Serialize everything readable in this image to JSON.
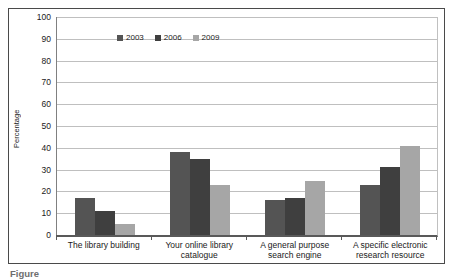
{
  "caption_partial": "Figure",
  "chart_data": {
    "type": "bar",
    "title": "",
    "ylabel": "Percentage",
    "xlabel": "",
    "ylim": [
      0,
      100
    ],
    "yticks": [
      0,
      10,
      20,
      30,
      40,
      50,
      60,
      70,
      80,
      90,
      100
    ],
    "grid": true,
    "legend_position": "top-left-inside",
    "categories": [
      "The library building",
      "Your online library catalogue",
      "A general purpose search engine",
      "A specific electronic research resource"
    ],
    "series": [
      {
        "name": "2003",
        "color": "#545454",
        "values": [
          17,
          38,
          16,
          23
        ]
      },
      {
        "name": "2006",
        "color": "#3f3f3f",
        "values": [
          11,
          35,
          17,
          31
        ]
      },
      {
        "name": "2009",
        "color": "#a6a6a6",
        "values": [
          5,
          23,
          25,
          41
        ]
      }
    ],
    "colors": {
      "axis": "#595959",
      "gridline": "#bfbfbf",
      "border": "#4a4a4a",
      "text": "#1a1a1a"
    }
  }
}
